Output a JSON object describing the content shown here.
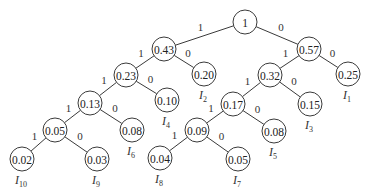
{
  "diagram": {
    "type": "huffman-tree",
    "nodes": [
      {
        "id": "n1",
        "value": "1",
        "x": 245,
        "y": 22
      },
      {
        "id": "n043",
        "value": "0.43",
        "x": 164,
        "y": 49
      },
      {
        "id": "n057",
        "value": "0.57",
        "x": 309,
        "y": 49
      },
      {
        "id": "n023",
        "value": "0.23",
        "x": 126,
        "y": 75
      },
      {
        "id": "n020",
        "value": "0.20",
        "x": 204,
        "y": 74,
        "leaf": "I",
        "sub": "2"
      },
      {
        "id": "n032",
        "value": "0.32",
        "x": 270,
        "y": 75
      },
      {
        "id": "n025",
        "value": "0.25",
        "x": 348,
        "y": 74,
        "leaf": "I",
        "sub": "1"
      },
      {
        "id": "n013",
        "value": "0.13",
        "x": 90,
        "y": 103
      },
      {
        "id": "n010",
        "value": "0.10",
        "x": 167,
        "y": 100,
        "leaf": "I",
        "sub": "4"
      },
      {
        "id": "n017",
        "value": "0.17",
        "x": 233,
        "y": 104
      },
      {
        "id": "n015",
        "value": "0.15",
        "x": 310,
        "y": 104,
        "leaf": "I",
        "sub": "3"
      },
      {
        "id": "n005a",
        "value": "0.05",
        "x": 55,
        "y": 130
      },
      {
        "id": "n008a",
        "value": "0.08",
        "x": 132,
        "y": 130,
        "leaf": "I",
        "sub": "6"
      },
      {
        "id": "n009",
        "value": "0.09",
        "x": 197,
        "y": 130
      },
      {
        "id": "n008b",
        "value": "0.08",
        "x": 274,
        "y": 131,
        "leaf": "I",
        "sub": "5"
      },
      {
        "id": "n002",
        "value": "0.02",
        "x": 22,
        "y": 159,
        "leaf": "I",
        "sub": "10"
      },
      {
        "id": "n003",
        "value": "0.03",
        "x": 97,
        "y": 159,
        "leaf": "I",
        "sub": "9"
      },
      {
        "id": "n004",
        "value": "0.04",
        "x": 160,
        "y": 158,
        "leaf": "I",
        "sub": "8"
      },
      {
        "id": "n005b",
        "value": "0.05",
        "x": 238,
        "y": 159,
        "leaf": "I",
        "sub": "7"
      }
    ],
    "edges": [
      {
        "from": "n1",
        "to": "n043",
        "label": "1"
      },
      {
        "from": "n1",
        "to": "n057",
        "label": "0"
      },
      {
        "from": "n043",
        "to": "n023",
        "label": "1"
      },
      {
        "from": "n043",
        "to": "n020",
        "label": "0"
      },
      {
        "from": "n057",
        "to": "n032",
        "label": "1"
      },
      {
        "from": "n057",
        "to": "n025",
        "label": "0"
      },
      {
        "from": "n023",
        "to": "n013",
        "label": "1"
      },
      {
        "from": "n023",
        "to": "n010",
        "label": "0"
      },
      {
        "from": "n032",
        "to": "n017",
        "label": "1"
      },
      {
        "from": "n032",
        "to": "n015",
        "label": "0"
      },
      {
        "from": "n013",
        "to": "n005a",
        "label": "1"
      },
      {
        "from": "n013",
        "to": "n008a",
        "label": "0"
      },
      {
        "from": "n017",
        "to": "n009",
        "label": "1"
      },
      {
        "from": "n017",
        "to": "n008b",
        "label": "0"
      },
      {
        "from": "n005a",
        "to": "n002",
        "label": "1"
      },
      {
        "from": "n005a",
        "to": "n003",
        "label": "0"
      },
      {
        "from": "n009",
        "to": "n004",
        "label": "1"
      },
      {
        "from": "n009",
        "to": "n005b",
        "label": "0"
      }
    ],
    "node_radius": 12,
    "colors": {
      "stroke": "#3a3a3a",
      "text": "#222222",
      "background": "#ffffff"
    }
  }
}
